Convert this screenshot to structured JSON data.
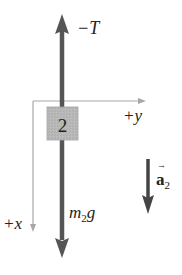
{
  "diagram": {
    "type": "free-body-diagram",
    "body": {
      "label": "2",
      "fill": "#b8b8b8"
    },
    "axes": {
      "horizontal_label": "+y",
      "vertical_label": "+x",
      "color": "#9a9a9a"
    },
    "forces": [
      {
        "name": "tension",
        "label": "−T",
        "direction": "up",
        "color": "#555555"
      },
      {
        "name": "weight",
        "label_main": "m",
        "label_sub": "2",
        "label_tail": "g",
        "direction": "down",
        "color": "#555555"
      }
    ],
    "acceleration": {
      "label_main": "a",
      "label_sub": "2",
      "vector_mark": "→",
      "direction": "down",
      "color": "#444444"
    }
  }
}
